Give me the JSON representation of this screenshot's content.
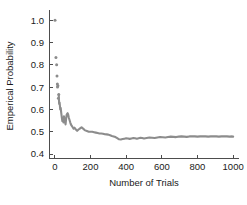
{
  "chart_data": {
    "type": "line",
    "title": "",
    "xlabel": "Number of Trials",
    "ylabel": "Emperical Probability",
    "xlim": [
      -30,
      1030
    ],
    "ylim": [
      0.38,
      1.03
    ],
    "xticks": [
      0,
      200,
      400,
      600,
      800,
      1000
    ],
    "xtick_labels": [
      "0",
      "200",
      "400",
      "600",
      "800",
      "1000"
    ],
    "yticks": [
      0.4,
      0.5,
      0.6,
      0.7,
      0.8,
      0.9,
      1.0
    ],
    "ytick_labels": [
      "0.4",
      "0.5",
      "0.6",
      "0.7",
      "0.8",
      "0.9",
      "1.0"
    ],
    "grid": false,
    "legend": null,
    "series_color": "#8c8c8c",
    "marker_color": "#8c8c8c",
    "spines": [
      "left",
      "bottom"
    ],
    "tick_direction": "out",
    "early_points": [
      {
        "x": 1,
        "y": 1.0
      },
      {
        "x": 6,
        "y": 0.833
      },
      {
        "x": 10,
        "y": 0.8
      },
      {
        "x": 12,
        "y": 0.75
      },
      {
        "x": 14,
        "y": 0.714
      },
      {
        "x": 15,
        "y": 0.7
      },
      {
        "x": 17,
        "y": 0.706
      },
      {
        "x": 20,
        "y": 0.65
      },
      {
        "x": 22,
        "y": 0.667
      }
    ],
    "x": [
      24,
      27,
      30,
      33,
      36,
      39,
      42,
      45,
      48,
      51,
      54,
      57,
      60,
      63,
      66,
      69,
      72,
      75,
      78,
      81,
      84,
      87,
      90,
      95,
      100,
      105,
      110,
      115,
      120,
      125,
      130,
      135,
      140,
      145,
      150,
      155,
      160,
      165,
      170,
      180,
      190,
      200,
      210,
      220,
      230,
      240,
      250,
      260,
      270,
      280,
      290,
      300,
      310,
      320,
      330,
      340,
      350,
      360,
      370,
      380,
      390,
      400,
      410,
      420,
      430,
      440,
      450,
      460,
      470,
      480,
      490,
      500,
      515,
      530,
      545,
      560,
      575,
      590,
      605,
      620,
      635,
      650,
      665,
      680,
      695,
      710,
      725,
      740,
      755,
      770,
      785,
      800,
      815,
      830,
      845,
      860,
      875,
      890,
      905,
      920,
      935,
      950,
      965,
      980,
      995,
      1000
    ],
    "values": [
      0.625,
      0.63,
      0.6,
      0.606,
      0.583,
      0.564,
      0.548,
      0.556,
      0.542,
      0.569,
      0.556,
      0.544,
      0.533,
      0.556,
      0.576,
      0.58,
      0.583,
      0.576,
      0.564,
      0.556,
      0.548,
      0.54,
      0.533,
      0.526,
      0.52,
      0.514,
      0.518,
      0.513,
      0.508,
      0.504,
      0.508,
      0.511,
      0.514,
      0.517,
      0.52,
      0.516,
      0.513,
      0.509,
      0.506,
      0.503,
      0.5,
      0.5,
      0.5,
      0.498,
      0.496,
      0.494,
      0.492,
      0.492,
      0.491,
      0.489,
      0.488,
      0.487,
      0.484,
      0.481,
      0.479,
      0.476,
      0.471,
      0.466,
      0.465,
      0.467,
      0.469,
      0.471,
      0.47,
      0.468,
      0.47,
      0.472,
      0.471,
      0.469,
      0.471,
      0.473,
      0.472,
      0.47,
      0.472,
      0.474,
      0.473,
      0.472,
      0.474,
      0.476,
      0.475,
      0.474,
      0.476,
      0.478,
      0.477,
      0.476,
      0.478,
      0.479,
      0.478,
      0.477,
      0.479,
      0.48,
      0.479,
      0.478,
      0.479,
      0.48,
      0.479,
      0.478,
      0.479,
      0.48,
      0.479,
      0.478,
      0.479,
      0.48,
      0.479,
      0.478,
      0.479,
      0.478
    ]
  }
}
